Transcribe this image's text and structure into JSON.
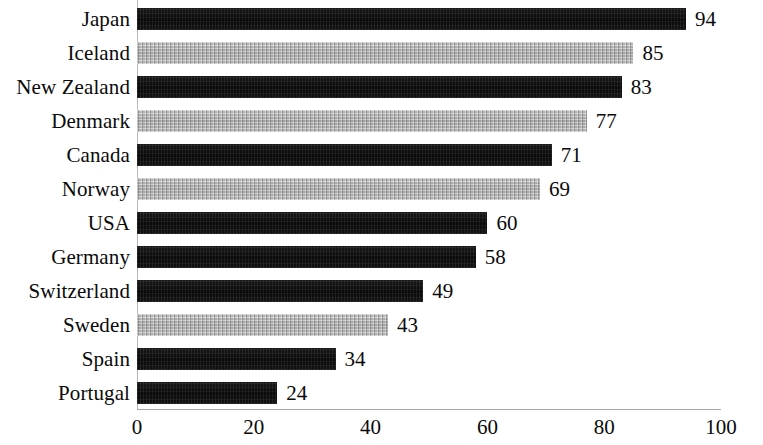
{
  "chart_data": {
    "type": "bar",
    "orientation": "horizontal",
    "title": "",
    "subtitle": "",
    "xlabel": "",
    "ylabel": "",
    "xlim": [
      0,
      100
    ],
    "xticks": [
      0,
      20,
      40,
      60,
      80,
      100
    ],
    "grid": false,
    "legend": null,
    "categories": [
      "Japan",
      "Iceland",
      "New Zealand",
      "Denmark",
      "Canada",
      "Norway",
      "USA",
      "Germany",
      "Switzerland",
      "Sweden",
      "Spain",
      "Portugal"
    ],
    "values": [
      94,
      85,
      83,
      77,
      71,
      69,
      60,
      58,
      49,
      43,
      34,
      24
    ],
    "value_labels": [
      "94",
      "85",
      "83",
      "77",
      "71",
      "69",
      "60",
      "58",
      "49",
      "43",
      "34",
      "24"
    ],
    "bar_shades": [
      "dark",
      "gray",
      "dark",
      "gray",
      "dark",
      "gray",
      "dark",
      "dark",
      "dark",
      "gray",
      "dark",
      "dark"
    ],
    "colors": {
      "dark_bar": "#0c0c0c",
      "gray_bar": "#b6b6b6",
      "text": "#0a0a0a",
      "axis": "#a8a8a8",
      "background": "#ffffff"
    }
  }
}
